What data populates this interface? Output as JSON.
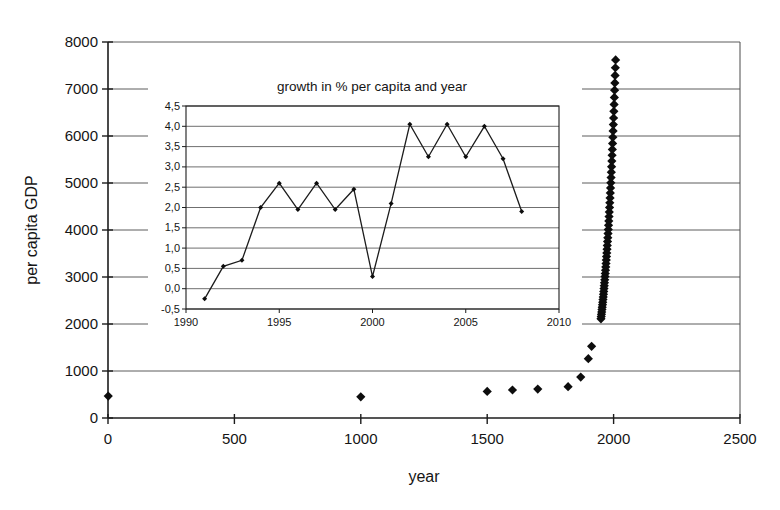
{
  "colors": {
    "background": "#ffffff",
    "ink": "#151515",
    "gridline": "#4a4a4a",
    "axis": "#1c1c1c",
    "marker": "#0d0d0d"
  },
  "chart_data": [
    {
      "type": "scatter",
      "title": "",
      "xlabel": "year",
      "ylabel": "per capita GDP",
      "xlim": [
        0,
        2500
      ],
      "ylim": [
        0,
        8000
      ],
      "x_ticks": [
        "0",
        "500",
        "1000",
        "1500",
        "2000",
        "2500"
      ],
      "x_tick_values": [
        0,
        500,
        1000,
        1500,
        2000,
        2500
      ],
      "y_ticks": [
        "0",
        "1000",
        "2000",
        "3000",
        "4000",
        "5000",
        "6000",
        "7000",
        "8000"
      ],
      "y_tick_values": [
        0,
        1000,
        2000,
        3000,
        4000,
        5000,
        6000,
        7000,
        8000
      ],
      "grid": "horizontal",
      "legend": "none",
      "marker": "diamond",
      "points": [
        [
          1,
          467
        ],
        [
          1000,
          450
        ],
        [
          1500,
          566
        ],
        [
          1600,
          596
        ],
        [
          1700,
          615
        ],
        [
          1820,
          667
        ],
        [
          1870,
          870
        ],
        [
          1900,
          1262
        ],
        [
          1913,
          1526
        ],
        [
          1950,
          2111
        ],
        [
          1951,
          2158
        ],
        [
          1952,
          2206
        ],
        [
          1953,
          2256
        ],
        [
          1954,
          2306
        ],
        [
          1955,
          2358
        ],
        [
          1956,
          2411
        ],
        [
          1957,
          2464
        ],
        [
          1958,
          2520
        ],
        [
          1959,
          2576
        ],
        [
          1960,
          2634
        ],
        [
          1961,
          2693
        ],
        [
          1962,
          2753
        ],
        [
          1963,
          2815
        ],
        [
          1964,
          2878
        ],
        [
          1965,
          2942
        ],
        [
          1966,
          3008
        ],
        [
          1967,
          3075
        ],
        [
          1968,
          3144
        ],
        [
          1969,
          3215
        ],
        [
          1970,
          3287
        ],
        [
          1971,
          3360
        ],
        [
          1972,
          3435
        ],
        [
          1973,
          3512
        ],
        [
          1974,
          3591
        ],
        [
          1975,
          3671
        ],
        [
          1976,
          3753
        ],
        [
          1977,
          3837
        ],
        [
          1978,
          3923
        ],
        [
          1979,
          4011
        ],
        [
          1980,
          4101
        ],
        [
          1981,
          4192
        ],
        [
          1982,
          4286
        ],
        [
          1983,
          4382
        ],
        [
          1984,
          4480
        ],
        [
          1985,
          4580
        ],
        [
          1986,
          4683
        ],
        [
          1987,
          4788
        ],
        [
          1988,
          4895
        ],
        [
          1989,
          5004
        ],
        [
          1990,
          5116
        ],
        [
          1991,
          5231
        ],
        [
          1992,
          5348
        ],
        [
          1993,
          5467
        ],
        [
          1994,
          5590
        ],
        [
          1995,
          5715
        ],
        [
          1996,
          5843
        ],
        [
          1997,
          5973
        ],
        [
          1998,
          6107
        ],
        [
          1999,
          6244
        ],
        [
          2000,
          6383
        ],
        [
          2001,
          6526
        ],
        [
          2002,
          6672
        ],
        [
          2003,
          6821
        ],
        [
          2004,
          6974
        ],
        [
          2005,
          7130
        ],
        [
          2006,
          7289
        ],
        [
          2007,
          7452
        ],
        [
          2008,
          7619
        ]
      ]
    },
    {
      "type": "line",
      "title": "growth in % per capita and year",
      "xlabel": "",
      "ylabel": "",
      "xlim": [
        1990,
        2010
      ],
      "ylim": [
        -0.5,
        4.5
      ],
      "x_ticks": [
        "1990",
        "1995",
        "2000",
        "2005",
        "2010"
      ],
      "x_tick_values": [
        1990,
        1995,
        2000,
        2005,
        2010
      ],
      "y_ticks": [
        "4,5",
        "4,0",
        "3,5",
        "3,0",
        "2,5",
        "2,0",
        "1,5",
        "1,0",
        "0,5",
        "0,0",
        "-0,5"
      ],
      "y_tick_values": [
        4.5,
        4.0,
        3.5,
        3.0,
        2.5,
        2.0,
        1.5,
        1.0,
        0.5,
        0.0,
        -0.5
      ],
      "grid": "horizontal",
      "legend": "none",
      "marker": "diamond",
      "points": [
        [
          1991,
          -0.25
        ],
        [
          1992,
          0.55
        ],
        [
          1993,
          0.7
        ],
        [
          1994,
          2.0
        ],
        [
          1995,
          2.6
        ],
        [
          1996,
          1.95
        ],
        [
          1997,
          2.6
        ],
        [
          1998,
          1.95
        ],
        [
          1999,
          2.45
        ],
        [
          2000,
          0.3
        ],
        [
          2001,
          2.1
        ],
        [
          2002,
          4.05
        ],
        [
          2003,
          3.25
        ],
        [
          2004,
          4.05
        ],
        [
          2005,
          3.25
        ],
        [
          2006,
          4.0
        ],
        [
          2007,
          3.2
        ],
        [
          2008,
          1.9
        ]
      ]
    }
  ]
}
